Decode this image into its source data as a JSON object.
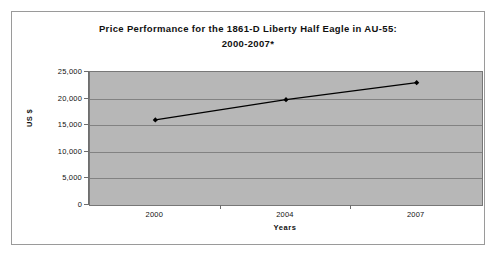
{
  "chart_data": {
    "type": "line",
    "title": "Price Performance for the 1861-D Liberty Half Eagle in AU-55:",
    "subtitle": "2000-2007*",
    "xlabel": "Years",
    "ylabel": "US $",
    "categories": [
      "2000",
      "2004",
      "2007"
    ],
    "values": [
      16000,
      19800,
      23000
    ],
    "series": [
      {
        "name": "1861-D Liberty Half Eagle AU-55",
        "values": [
          16000,
          19800,
          23000
        ]
      }
    ],
    "ylim": [
      0,
      25000
    ],
    "yticks": [
      "0",
      "5,000",
      "10,000",
      "15,000",
      "20,000",
      "25,000"
    ],
    "ytick_values": [
      0,
      5000,
      10000,
      15000,
      20000,
      25000
    ],
    "xticks": [
      "2000",
      "2004",
      "2007"
    ],
    "grid": true,
    "legend": "none",
    "plot_background": "#b7b7b7",
    "line_color": "#000000",
    "marker": "diamond",
    "figure_background": "#ffffff"
  }
}
